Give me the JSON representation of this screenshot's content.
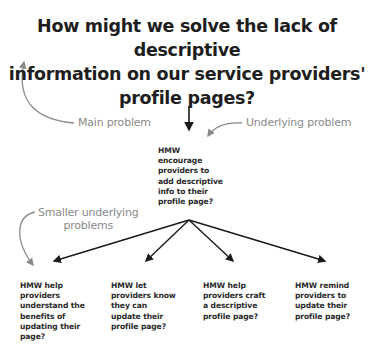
{
  "main_problem": {
    "lines": [
      "How might we solve the lack of descriptive",
      "information on our service providers'",
      "profile pages?"
    ]
  },
  "annotations": {
    "main_problem_label": "Main problem",
    "underlying_problem_label": "Underlying problem",
    "smaller_underlying_label_line1": "Smaller underlying",
    "smaller_underlying_label_line2": "problems"
  },
  "underlying_problem": {
    "lines": [
      "HMW",
      "encourage",
      "providers to",
      "add descriptive",
      "info to their",
      "profile page?"
    ]
  },
  "smaller_problems": [
    {
      "lines": [
        "HMW help",
        "providers",
        "understand the",
        "benefits of",
        "updating their",
        "page?"
      ]
    },
    {
      "lines": [
        "HMW let",
        "providers know",
        "they can",
        "update their",
        "profile page?"
      ]
    },
    {
      "lines": [
        "HMW help",
        "providers craft",
        "a descriptive",
        "profile page?"
      ]
    },
    {
      "lines": [
        "HMW remind",
        "providers to",
        "update their",
        "profile page?"
      ]
    }
  ],
  "colors": {
    "text_dark": "#1e1e1e",
    "annotation_gray": "#8a8a8a",
    "arrow_dark": "#1a1a1a"
  }
}
